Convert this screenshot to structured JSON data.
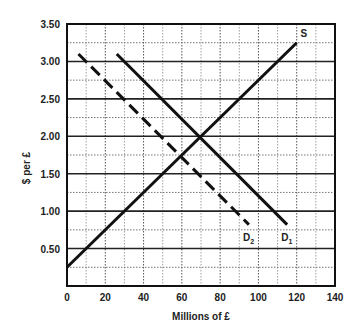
{
  "chart_data": {
    "type": "line",
    "title": "",
    "xlabel": "Millions of £",
    "ylabel": "$ per £",
    "xlim": [
      0,
      140
    ],
    "ylim": [
      0,
      3.5
    ],
    "x_ticks": [
      "0",
      "20",
      "40",
      "60",
      "80",
      "100",
      "120",
      "140"
    ],
    "y_ticks": [
      "0.50",
      "1.00",
      "1.50",
      "2.00",
      "2.50",
      "3.00",
      "3.50"
    ],
    "grid": true,
    "series": [
      {
        "name": "S",
        "style": "solid",
        "points": [
          [
            0,
            0.25
          ],
          [
            120,
            3.25
          ]
        ]
      },
      {
        "name": "D1",
        "label_main": "D",
        "label_sub": "1",
        "style": "solid",
        "points": [
          [
            26,
            3.1
          ],
          [
            115,
            0.82
          ]
        ]
      },
      {
        "name": "D2",
        "label_main": "D",
        "label_sub": "2",
        "style": "dashed",
        "points": [
          [
            6,
            3.1
          ],
          [
            95,
            0.82
          ]
        ]
      }
    ],
    "annotations": [
      {
        "text": "S",
        "x": 122,
        "y": 3.35
      },
      {
        "text": "D2",
        "x": 94,
        "y": 0.62
      },
      {
        "text": "D1",
        "x": 114,
        "y": 0.62
      }
    ],
    "intersections": [
      {
        "curves": [
          "S",
          "D1"
        ],
        "x": 70,
        "y": 2.0
      },
      {
        "curves": [
          "S",
          "D2"
        ],
        "x": 60,
        "y": 1.75
      }
    ]
  }
}
